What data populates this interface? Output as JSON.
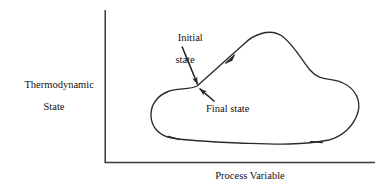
{
  "figure": {
    "type": "diagram",
    "background_color": "#ffffff",
    "line_color": "#2b2b2b"
  },
  "axes": {
    "y_label_line1": "Thermodynamic",
    "y_label_line2": "State",
    "x_label": "Process Variable",
    "origin": {
      "x": 105,
      "y": 162
    },
    "y_axis_top": {
      "x": 105,
      "y": 10
    },
    "x_axis_right": {
      "x": 375,
      "y": 162
    },
    "ticks": "none",
    "grid": "off"
  },
  "annotations": {
    "initial_state_line1": "Initial",
    "initial_state_line2": "state",
    "final_state": "Final state",
    "initial_leader": {
      "from_x": 183,
      "from_y": 46,
      "to_x": 196,
      "to_y": 84
    },
    "final_leader": {
      "from_x": 214,
      "from_y": 101,
      "to_x": 199,
      "to_y": 88
    },
    "marked_point": {
      "x": 197,
      "y": 86
    }
  },
  "cycle": {
    "direction": "clockwise",
    "closed": true,
    "arrow_count": 3,
    "arrows": [
      {
        "name": "ascending-limb-arrow",
        "x": 231,
        "y": 58,
        "angle_deg": -47
      },
      {
        "name": "bottom-left-arrow",
        "x": 173,
        "y": 138,
        "angle_deg": 200
      },
      {
        "name": "bottom-right-arrow",
        "x": 315,
        "y": 141,
        "angle_deg": 181
      }
    ],
    "path": "M 197 86 C 215 70 232 56 248 42 C 258 33 272 29 283 37 C 295 46 301 59 310 70 C 320 82 332 78 344 84 C 357 90 361 101 358 112 C 354 126 344 136 330 140 C 300 146 270 144 240 143 C 215 142 190 141 172 138 C 160 136 152 128 151 116 C 150 104 158 96 168 92 C 178 88 189 89 197 86 Z"
  }
}
